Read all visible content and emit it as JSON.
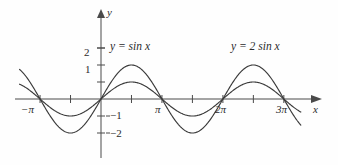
{
  "figure": {
    "background_color": "#fefefe",
    "curve_color": "#3a3a3a",
    "axis_color": "#4a4a4a"
  },
  "axes": {
    "x_axis_label": "x",
    "y_axis_label": "y",
    "x_ticks": [
      {
        "label": "−π",
        "value": -3.14159
      },
      {
        "label": "",
        "value": -1.5708
      },
      {
        "label": "",
        "value": 1.5708
      },
      {
        "label": "π",
        "value": 3.14159
      },
      {
        "label": "",
        "value": 4.71239
      },
      {
        "label": "2π",
        "value": 6.28319
      },
      {
        "label": "",
        "value": 7.85398
      },
      {
        "label": "3π",
        "value": 9.42478
      }
    ],
    "y_ticks": [
      {
        "label": "",
        "value": 3
      },
      {
        "label": "2",
        "value": 2
      },
      {
        "label": "1",
        "value": 1
      },
      {
        "label": "−1",
        "value": -1
      },
      {
        "label": "−2",
        "value": -2
      }
    ],
    "xlim": [
      -4.4,
      10.6
    ],
    "ylim": [
      -2.9,
      3.5
    ]
  },
  "curve_labels": {
    "sin": {
      "lhs": "y",
      "eq": "=",
      "fn": "sin",
      "arg": "x",
      "full": "y = sin x"
    },
    "two_sin": {
      "lhs": "y",
      "eq": "=",
      "coeff": "2",
      "fn": "sin",
      "arg": "x",
      "full": "y = 2 sin x"
    }
  },
  "chart_data": {
    "type": "line",
    "title": "",
    "xlabel": "x",
    "ylabel": "y",
    "xlim": [
      -4.4,
      10.6
    ],
    "ylim": [
      -2.9,
      3.5
    ],
    "grid": false,
    "legend_position": "inline-annotations",
    "x_tick_labels": [
      "−π",
      "π",
      "2π",
      "3π"
    ],
    "x_tick_values": [
      -3.14159,
      3.14159,
      6.28319,
      9.42478
    ],
    "y_tick_labels": [
      "2",
      "1",
      "−1",
      "−2"
    ],
    "y_tick_values": [
      2,
      1,
      -1,
      -2
    ],
    "series": [
      {
        "name": "y = sin x",
        "amplitude": 1,
        "period": 6.28319,
        "expression": "sin(x)",
        "x_domain": [
          -4.2,
          10.3
        ],
        "key_points": [
          {
            "x": -3.14159,
            "y": 0
          },
          {
            "x": -1.5708,
            "y": -1
          },
          {
            "x": 0,
            "y": 0
          },
          {
            "x": 1.5708,
            "y": 1
          },
          {
            "x": 3.14159,
            "y": 0
          },
          {
            "x": 4.71239,
            "y": -1
          },
          {
            "x": 6.28319,
            "y": 0
          },
          {
            "x": 7.85398,
            "y": 1
          },
          {
            "x": 9.42478,
            "y": 0
          }
        ]
      },
      {
        "name": "y = 2 sin x",
        "amplitude": 2,
        "period": 6.28319,
        "expression": "2*sin(x)",
        "x_domain": [
          -4.2,
          10.3
        ],
        "key_points": [
          {
            "x": -3.14159,
            "y": 0
          },
          {
            "x": -1.5708,
            "y": -2
          },
          {
            "x": 0,
            "y": 0
          },
          {
            "x": 1.5708,
            "y": 2
          },
          {
            "x": 3.14159,
            "y": 0
          },
          {
            "x": 4.71239,
            "y": -2
          },
          {
            "x": 6.28319,
            "y": 0
          },
          {
            "x": 7.85398,
            "y": 2
          },
          {
            "x": 9.42478,
            "y": 0
          }
        ]
      }
    ]
  }
}
